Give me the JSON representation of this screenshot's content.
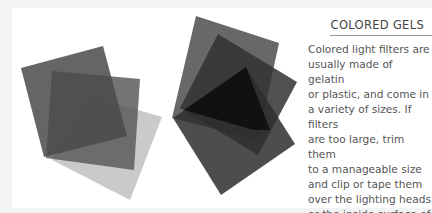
{
  "sidebar": {
    "heading": "COLORED GELS",
    "body": "Colored light filters are\nusually made of gelatin\nor plastic, and come in\na variety of sizes. If filters\nare too large, trim them\nto a manageable size\nand clip or tape them\nover the lighting heads\nor the inside surface of\na diffuser."
  },
  "illustration": {
    "description": "Overlapping translucent gel filter sheets in gray tones",
    "colors": {
      "light_gel": "#c4c4c4",
      "medium_gel": "#6e6e6e",
      "dark_gel": "#444444",
      "black_gel": "#111111"
    }
  }
}
